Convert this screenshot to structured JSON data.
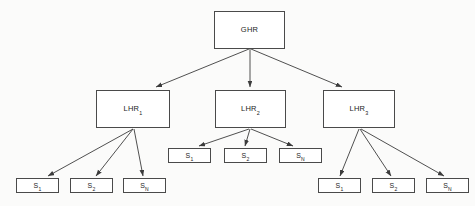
{
  "diagram": {
    "type": "tree-diagram",
    "background_color": "#fbfbfa",
    "box_fill_color": "#ffffff",
    "box_border_color": "#4a4a4a",
    "edge_color": "#3c3c3c",
    "text_color": "#1d1d1d"
  },
  "nodes": {
    "root": {
      "id": "ghr",
      "label": "GHR",
      "base": "GHR",
      "subscript": ""
    },
    "level2": [
      {
        "id": "lhr1",
        "label": "LHR1",
        "base": "LHR",
        "subscript": "1"
      },
      {
        "id": "lhr2",
        "label": "LHR2",
        "base": "LHR",
        "subscript": "2"
      },
      {
        "id": "lhr3",
        "label": "LHR3",
        "base": "LHR",
        "subscript": "3"
      }
    ],
    "level3": [
      {
        "parent": "lhr1",
        "children": [
          {
            "id": "lhr1-s1",
            "label": "S1",
            "base": "S",
            "subscript": "1"
          },
          {
            "id": "lhr1-s2",
            "label": "S2",
            "base": "S",
            "subscript": "2"
          },
          {
            "id": "lhr1-sn",
            "label": "SN",
            "base": "S",
            "subscript": "N"
          }
        ]
      },
      {
        "parent": "lhr2",
        "children": [
          {
            "id": "lhr2-s1",
            "label": "S1",
            "base": "S",
            "subscript": "1"
          },
          {
            "id": "lhr2-s2",
            "label": "S2",
            "base": "S",
            "subscript": "2"
          },
          {
            "id": "lhr2-sn",
            "label": "SN",
            "base": "S",
            "subscript": "N"
          }
        ]
      },
      {
        "parent": "lhr3",
        "children": [
          {
            "id": "lhr3-s1",
            "label": "S1",
            "base": "S",
            "subscript": "1"
          },
          {
            "id": "lhr3-s2",
            "label": "S2",
            "base": "S",
            "subscript": "2"
          },
          {
            "id": "lhr3-sn",
            "label": "SN",
            "base": "S",
            "subscript": "N"
          }
        ]
      }
    ]
  }
}
